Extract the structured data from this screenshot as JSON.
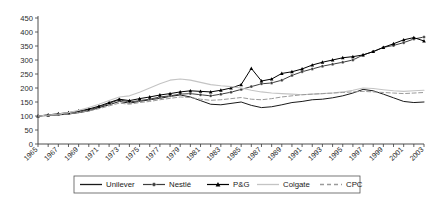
{
  "chart_data": {
    "type": "line",
    "title": "",
    "xlabel": "",
    "ylabel": "",
    "xlim": [
      1965,
      2003
    ],
    "ylim": [
      0,
      450
    ],
    "ytick_step": 50,
    "yticks": [
      0,
      50,
      100,
      150,
      200,
      250,
      300,
      350,
      400,
      450
    ],
    "xticks": [
      1965,
      1967,
      1969,
      1971,
      1973,
      1975,
      1977,
      1979,
      1981,
      1983,
      1985,
      1987,
      1989,
      1991,
      1993,
      1995,
      1997,
      1999,
      2001,
      2003
    ],
    "xtick_labels": [
      "1965",
      "1967",
      "1969",
      "1971",
      "1973",
      "1975",
      "1977",
      "1979",
      "1981",
      "1983",
      "1985",
      "1987",
      "1989",
      "1991",
      "1993",
      "1995",
      "1997",
      "1999",
      "2001",
      "2003"
    ],
    "grid": false,
    "legend_position": "bottom",
    "x": [
      1965,
      1966,
      1967,
      1968,
      1969,
      1970,
      1971,
      1972,
      1973,
      1974,
      1975,
      1976,
      1977,
      1978,
      1979,
      1980,
      1981,
      1982,
      1983,
      1984,
      1985,
      1986,
      1987,
      1988,
      1989,
      1990,
      1991,
      1992,
      1993,
      1994,
      1995,
      1996,
      1997,
      1998,
      1999,
      2000,
      2001,
      2002,
      2003
    ],
    "series": [
      {
        "name": "Unilever",
        "color": "#1a1a1a",
        "style": "solid",
        "marker": "none",
        "values": [
          100,
          102,
          104,
          107,
          112,
          118,
          130,
          140,
          152,
          146,
          152,
          158,
          163,
          170,
          175,
          168,
          155,
          142,
          140,
          145,
          150,
          138,
          130,
          133,
          140,
          148,
          152,
          158,
          160,
          165,
          172,
          182,
          195,
          190,
          178,
          165,
          152,
          148,
          150
        ]
      },
      {
        "name": "Nestlé",
        "color": "#3d3d3d",
        "style": "solid",
        "marker": "circle",
        "values": [
          100,
          103,
          106,
          110,
          115,
          122,
          132,
          145,
          158,
          150,
          155,
          160,
          168,
          172,
          178,
          180,
          176,
          172,
          178,
          185,
          195,
          205,
          215,
          218,
          228,
          245,
          258,
          268,
          278,
          285,
          292,
          300,
          318,
          330,
          345,
          352,
          362,
          375,
          382
        ]
      },
      {
        "name": "P&G",
        "color": "#000000",
        "style": "solid",
        "marker": "triangle",
        "values": [
          100,
          104,
          108,
          112,
          118,
          125,
          135,
          148,
          160,
          155,
          162,
          168,
          175,
          180,
          186,
          190,
          188,
          186,
          192,
          200,
          212,
          270,
          225,
          232,
          252,
          258,
          268,
          282,
          292,
          300,
          308,
          312,
          318,
          330,
          345,
          358,
          372,
          380,
          368
        ]
      },
      {
        "name": "Colgate",
        "color": "#c4c4c4",
        "style": "solid",
        "marker": "none",
        "values": [
          100,
          103,
          107,
          112,
          120,
          130,
          142,
          155,
          168,
          172,
          185,
          200,
          215,
          228,
          232,
          228,
          220,
          212,
          208,
          205,
          200,
          192,
          186,
          182,
          180,
          178,
          176,
          178,
          180,
          182,
          186,
          192,
          200,
          198,
          194,
          190,
          188,
          190,
          192
        ]
      },
      {
        "name": "CPC",
        "color": "#9a9a9a",
        "style": "dashed",
        "marker": "none",
        "values": [
          100,
          102,
          105,
          108,
          113,
          118,
          126,
          136,
          146,
          142,
          148,
          152,
          158,
          163,
          168,
          166,
          160,
          156,
          158,
          162,
          166,
          160,
          158,
          162,
          168,
          172,
          176,
          178,
          180,
          182,
          184,
          186,
          188,
          186,
          184,
          182,
          180,
          182,
          184
        ]
      }
    ]
  },
  "legend": {
    "items": [
      {
        "label": "Unilever"
      },
      {
        "label": "Nestlé"
      },
      {
        "label": "P&G"
      },
      {
        "label": "Colgate"
      },
      {
        "label": "CPC"
      }
    ]
  }
}
